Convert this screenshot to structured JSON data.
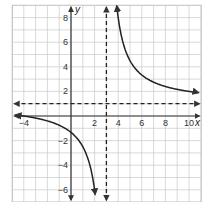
{
  "chart_data": {
    "type": "line",
    "title": "",
    "xlabel": "x",
    "ylabel": "y",
    "xlim": [
      -5,
      11
    ],
    "ylim": [
      -7,
      9
    ],
    "grid": true,
    "x_ticks": [
      -4,
      2,
      4,
      6,
      8,
      10
    ],
    "y_ticks": [
      8,
      6,
      4,
      2,
      -2,
      -4,
      -6
    ],
    "x_tick_labels": [
      "-4",
      "2",
      "4",
      "6",
      "8",
      "10"
    ],
    "y_tick_labels": [
      "8",
      "6",
      "4",
      "2",
      "-2",
      "-4",
      "-6"
    ],
    "function": "y = a/(x - 3) + 1, a ≈ 7",
    "asymptotes": {
      "vertical": {
        "x": 3,
        "style": "dashed"
      },
      "horizontal": {
        "y": 1,
        "style": "dashed"
      }
    },
    "series": [
      {
        "name": "left branch",
        "x": [
          -4.5,
          -4,
          -2,
          0,
          1,
          1.5,
          2,
          2.05
        ],
        "y": [
          -0.1,
          0,
          -0.4,
          -1.3,
          -2.5,
          -3.7,
          -6,
          -6.4
        ]
      },
      {
        "name": "right branch",
        "x": [
          3.9,
          4,
          5,
          6,
          7,
          8,
          9,
          10,
          10.8
        ],
        "y": [
          8.8,
          8,
          4.5,
          3.3,
          2.75,
          2.4,
          2.17,
          2.0,
          1.9
        ]
      }
    ]
  },
  "colors": {
    "grid": "#c8c8c8",
    "axis": "#333333",
    "curve": "#222222",
    "asymptote": "#222222"
  }
}
